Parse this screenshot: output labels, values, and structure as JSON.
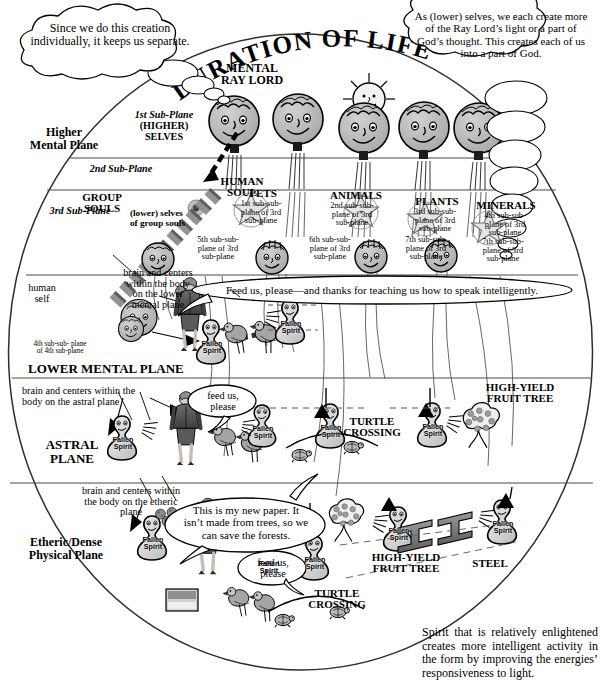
{
  "title": "DURATION OF LIFE",
  "top_center_label": "MENTAL\nRAY LORD",
  "bubbles": {
    "left_top": "Since we do this creation individually, it keeps us separate.",
    "right_top": "As (lower) selves, we each create more of the Ray Lord’s light or a part of God’s thought. This creates each of us into a part of God.",
    "feed_teach": "Feed us, please—and thanks for teaching us how to speak intelligently.",
    "feed_astral": "feed us,\nplease",
    "new_paper": "This is my new paper. It isn’t made from trees, so we can save the forests.",
    "feed_etheric": "feed us,\nplease"
  },
  "planes": {
    "higher_mental": "Higher\nMental Plane",
    "lower_mental": "LOWER MENTAL PLANE",
    "astral": "ASTRAL\nPLANE",
    "etheric": "Etheric/Dense\nPhysical Plane"
  },
  "subplanes": {
    "first": "1st Sub-Plane",
    "first_sub": "(HIGHER)\nSELVES",
    "second": "2nd Sub-Plane",
    "third": "3rd Sub-Plane",
    "group_souls": "GROUP\nSOULS",
    "lower_selves_group": "(lower) selves\nof group souls",
    "human_soul": "HUMAN\nSOUL",
    "human_self": "human\nself",
    "human_self_plane": "4th sub-sub- plane\nof 4th sub-plane"
  },
  "kingdoms": [
    {
      "name": "PETS",
      "star_plane": "1st sub-sub-\nplane of 3rd\nsub-plane",
      "soul_plane": "5th sub-sub-\nplane of 3rd\nsub-plane"
    },
    {
      "name": "ANIMALS",
      "star_plane": "2nd sub-sub-\nplane of 3rd\nsub-plane",
      "soul_plane": "6th sub-sub-\nplane of 3rd\nsub-plane"
    },
    {
      "name": "PLANTS",
      "star_plane": "3rd sub-sub-\nplane of 3rd\nsub-plane",
      "soul_plane": "7th sub-sub-\nplane of 3rd\nsub-plane"
    },
    {
      "name": "MINERALS",
      "star_plane": "4th sub-sub-\nplane of 3rd\nsub-plane",
      "soul_plane": ""
    }
  ],
  "annotations": {
    "brain_lower_mental": "brain and centers\nwithin the body\non the lower\nmental plane",
    "brain_astral": "brain and centers within the\nbody on the astral plane",
    "brain_etheric": "brain and centers within\nthe body on the etheric\nplane"
  },
  "objects": {
    "turtle_crossing_astral": "TURTLE\nCROSSING",
    "turtle_crossing_etheric": "TURTLE\nCROSSING",
    "fruit_tree_astral": "HIGH-YIELD\nFRUIT TREE",
    "fruit_tree_etheric": "HIGH-YIELD\nFRUIT TREE",
    "steel": "STEEL",
    "fallen_spirit": "Fallen\nSpirit"
  },
  "footer": "Spirit that is relatively enlightened creates more intelligent activity in the form by improving the energies’ responsiveness to light.",
  "colors": {
    "ink": "#000000",
    "face_fill": "#b4b4b4",
    "spirit_fill": "#d9d9d9",
    "steel_fill": "#7a7a7a",
    "line": "#444444",
    "paper": "#ffffff"
  }
}
